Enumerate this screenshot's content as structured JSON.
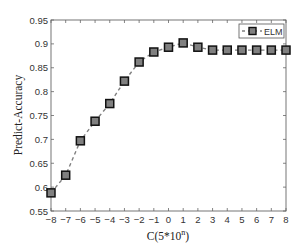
{
  "chart_data": {
    "type": "line",
    "title": "",
    "xlabel": "C(5*10^n)",
    "xlabel_base": "C(5*10",
    "xlabel_sup": "n",
    "xlabel_close": ")",
    "ylabel": "Predict-Accuracy",
    "xlim": [
      -8,
      8
    ],
    "ylim": [
      0.55,
      0.95
    ],
    "grid": false,
    "legend_position": "top-right",
    "x_ticks": [
      -8,
      -7,
      -6,
      -5,
      -4,
      -3,
      -2,
      -1,
      0,
      1,
      2,
      3,
      4,
      5,
      6,
      7,
      8
    ],
    "x_tick_labels": [
      "−8",
      "−7",
      "−6",
      "−5",
      "−4",
      "−3",
      "−2",
      "−1",
      "0",
      "1",
      "2",
      "3",
      "4",
      "5",
      "6",
      "7",
      "8"
    ],
    "y_ticks": [
      0.55,
      0.6,
      0.65,
      0.7,
      0.75,
      0.8,
      0.85,
      0.9,
      0.95
    ],
    "y_tick_labels": [
      "0.55",
      "0.6",
      "0.65",
      "0.7",
      "0.75",
      "0.8",
      "0.85",
      "0.9",
      "0.95"
    ],
    "x": [
      -8,
      -7,
      -6,
      -5,
      -4,
      -3,
      -2,
      -1,
      0,
      1,
      2,
      3,
      4,
      5,
      6,
      7,
      8
    ],
    "series": [
      {
        "name": "ELM",
        "line_style": "dashed",
        "marker": "square",
        "line_color": "#808080",
        "marker_fill": "#808080",
        "marker_edge": "#111111",
        "values": [
          0.588,
          0.625,
          0.697,
          0.738,
          0.775,
          0.822,
          0.862,
          0.883,
          0.893,
          0.902,
          0.893,
          0.887,
          0.887,
          0.887,
          0.887,
          0.887,
          0.887
        ]
      }
    ]
  }
}
